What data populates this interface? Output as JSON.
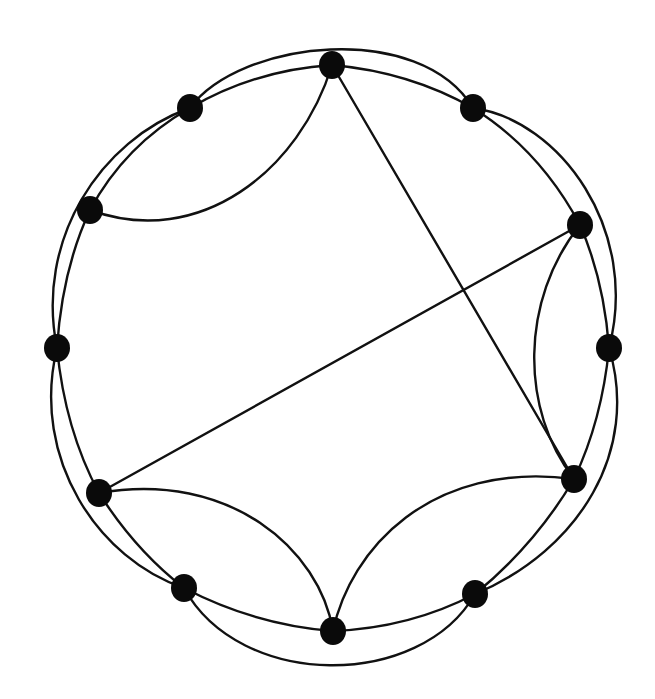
{
  "diagram": {
    "type": "graph",
    "colors": {
      "background": "#ffffff",
      "edge": "#111111",
      "node": "#0a0a0a"
    },
    "node_radius": 13,
    "nodes": [
      {
        "id": 0,
        "x": 332,
        "y": 65
      },
      {
        "id": 1,
        "x": 190,
        "y": 108
      },
      {
        "id": 2,
        "x": 473,
        "y": 108
      },
      {
        "id": 3,
        "x": 90,
        "y": 210
      },
      {
        "id": 4,
        "x": 580,
        "y": 225
      },
      {
        "id": 5,
        "x": 57,
        "y": 348
      },
      {
        "id": 6,
        "x": 609,
        "y": 348
      },
      {
        "id": 7,
        "x": 99,
        "y": 493
      },
      {
        "id": 8,
        "x": 574,
        "y": 479
      },
      {
        "id": 9,
        "x": 184,
        "y": 588
      },
      {
        "id": 10,
        "x": 475,
        "y": 594
      },
      {
        "id": 11,
        "x": 333,
        "y": 631
      }
    ],
    "edges": [
      {
        "from": 0,
        "to": 1,
        "kind": "cycle",
        "path": "M332,65 Q255,70 190,108"
      },
      {
        "from": 1,
        "to": 3,
        "kind": "cycle",
        "path": "M190,108 Q125,145 90,210"
      },
      {
        "from": 3,
        "to": 5,
        "kind": "cycle",
        "path": "M90,210 Q62,270 57,348"
      },
      {
        "from": 5,
        "to": 7,
        "kind": "cycle",
        "path": "M57,348 Q65,430 99,493"
      },
      {
        "from": 7,
        "to": 9,
        "kind": "cycle",
        "path": "M99,493 Q135,550 184,588"
      },
      {
        "from": 9,
        "to": 11,
        "kind": "cycle",
        "path": "M184,588 Q255,625 333,631"
      },
      {
        "from": 11,
        "to": 10,
        "kind": "cycle",
        "path": "M333,631 Q410,628 475,594"
      },
      {
        "from": 10,
        "to": 8,
        "kind": "cycle",
        "path": "M475,594 Q535,545 574,479"
      },
      {
        "from": 8,
        "to": 6,
        "kind": "cycle",
        "path": "M574,479 Q602,420 609,348"
      },
      {
        "from": 6,
        "to": 4,
        "kind": "cycle",
        "path": "M609,348 Q604,280 580,225"
      },
      {
        "from": 4,
        "to": 2,
        "kind": "cycle",
        "path": "M580,225 Q540,150 473,108"
      },
      {
        "from": 2,
        "to": 0,
        "kind": "cycle",
        "path": "M473,108 Q410,72 332,65"
      },
      {
        "from": 1,
        "to": 2,
        "kind": "outer",
        "path": "M190,108 C240,40 420,20 473,108"
      },
      {
        "from": 1,
        "to": 5,
        "kind": "outer",
        "path": "M190,108 C100,140 35,240 57,348"
      },
      {
        "from": 5,
        "to": 9,
        "kind": "outer",
        "path": "M57,348 C30,460 100,560 184,588"
      },
      {
        "from": 9,
        "to": 10,
        "kind": "outer",
        "path": "M184,588 C240,690 420,690 475,594"
      },
      {
        "from": 10,
        "to": 6,
        "kind": "outer",
        "path": "M475,594 C580,550 640,450 609,348"
      },
      {
        "from": 6,
        "to": 2,
        "kind": "outer",
        "path": "M609,348 C640,230 560,120 473,108"
      },
      {
        "from": 0,
        "to": 3,
        "kind": "chord",
        "path": "M332,65 C300,170 200,250 90,210"
      },
      {
        "from": 4,
        "to": 8,
        "kind": "chord",
        "path": "M580,225 C520,300 520,410 574,479"
      },
      {
        "from": 7,
        "to": 11,
        "kind": "chord",
        "path": "M99,493 C230,470 320,550 333,631"
      },
      {
        "from": 8,
        "to": 11,
        "kind": "chord",
        "path": "M574,479 C430,460 350,550 333,631"
      },
      {
        "from": 0,
        "to": 8,
        "kind": "straight",
        "path": "M332,65 L574,479"
      },
      {
        "from": 4,
        "to": 7,
        "kind": "straight",
        "path": "M580,225 L99,493"
      }
    ]
  }
}
